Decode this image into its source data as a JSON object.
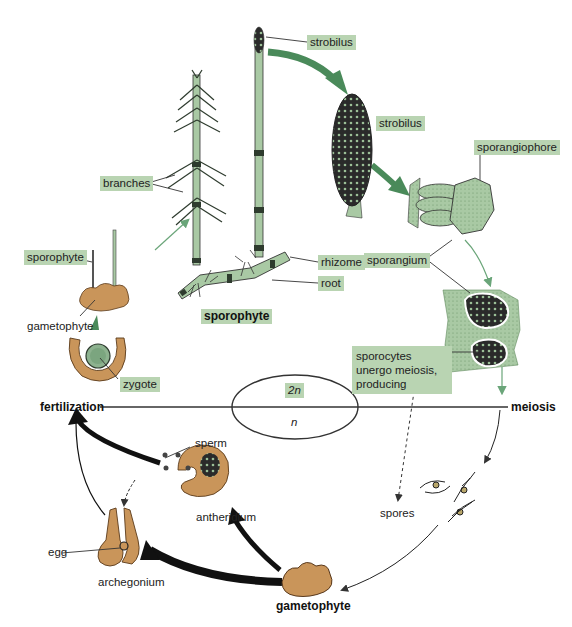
{
  "diagram": {
    "colors": {
      "label_bg": "#b9d4b2",
      "sporophyte_green": "#a9c9a4",
      "dark_green_arrow": "#4a8a5a",
      "gametophyte_tan": "#c9955a",
      "black_arrow": "#111111",
      "line": "#333333"
    },
    "ploidy": {
      "upper": "2n",
      "lower": "n"
    },
    "phase_labels": {
      "fertilization": "fertilization",
      "meiosis": "meiosis"
    },
    "sporophyte_labels": {
      "strobilus_top": "strobilus",
      "strobilus_mid": "strobilus",
      "sporangiophore": "sporangiophore",
      "sporangium": "sporangium",
      "branches": "branches",
      "rhizome": "rhizome",
      "root": "root",
      "sporophyte_caption": "sporophyte",
      "sporocytes_note": "sporocytes unergo meiosis, producing"
    },
    "gametophyte_labels": {
      "young_sporophyte": "sporophyte",
      "gametophyte_small": "gametophyte",
      "zygote": "zygote",
      "spores": "spores",
      "sperm": "sperm",
      "antheridium": "antheridium",
      "egg": "egg",
      "archegonium": "archegonium",
      "gametophyte_caption": "gametophyte"
    }
  }
}
